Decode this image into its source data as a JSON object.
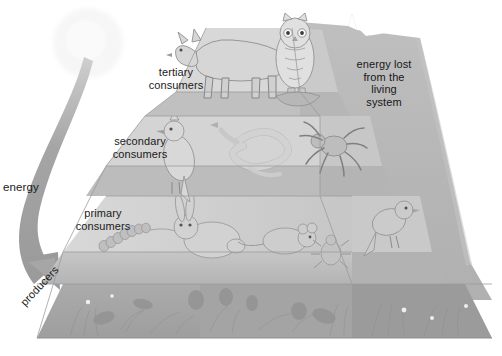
{
  "diagram": {
    "type": "energy-pyramid",
    "labels": {
      "tertiary": "tertiary\nconsumers",
      "secondary": "secondary\nconsumers",
      "primary": "primary\nconsumers",
      "producers": "producers",
      "energy": "energy",
      "energy_lost": "energy lost\nfrom the\nliving\nsystem"
    },
    "tiers": [
      {
        "level": 4,
        "name": "tertiary consumers",
        "organisms": [
          "wolf",
          "owl"
        ]
      },
      {
        "level": 3,
        "name": "secondary consumers",
        "organisms": [
          "bird",
          "snake",
          "spider"
        ]
      },
      {
        "level": 2,
        "name": "primary consumers",
        "organisms": [
          "caterpillar",
          "rabbit",
          "mouse",
          "beetle",
          "finch"
        ]
      },
      {
        "level": 1,
        "name": "producers",
        "organisms": [
          "leafy plant",
          "strawberry plant",
          "grasses",
          "wildflowers"
        ]
      }
    ],
    "sun": {
      "name": "sun"
    },
    "arrow": {
      "name": "energy-flow-arrow",
      "direction": "sun-to-producers"
    },
    "colors": {
      "background": "#ffffff",
      "energy_lost_gray": "#b8b8b8",
      "tier_top_face": "#cfcfcf",
      "tier_front_face": "#bdbdbd",
      "producer_band": "#a8a8a8",
      "arrow": "#9d9d9d",
      "sun": "#f4f4f4",
      "text": "#1a1a1a"
    }
  }
}
